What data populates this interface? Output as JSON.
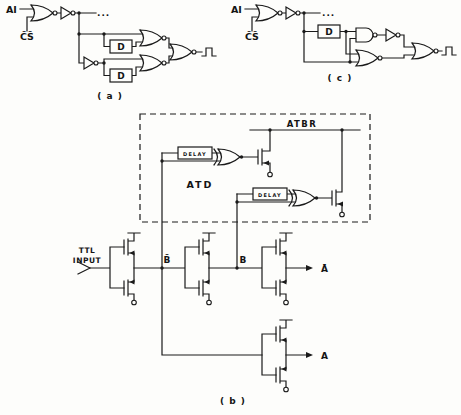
{
  "figure": {
    "panels": {
      "a": {
        "caption": "( a )",
        "address_input_label": "AI",
        "chip_select_label": "C̄S̄",
        "delay_blocks": [
          "D",
          "D"
        ],
        "continuation_dots": "..."
      },
      "c": {
        "caption": "( c )",
        "address_input_label": "AI",
        "chip_select_label": "C̄S̄",
        "delay_blocks": [
          "D"
        ],
        "continuation_dots": "..."
      },
      "b": {
        "caption": "( b )",
        "block_labels": {
          "atd": "ATD",
          "atbr": "ATBR"
        },
        "delay_blocks": [
          "DELAY",
          "DELAY"
        ],
        "input_label_line1": "TTL",
        "input_label_line2": "INPUT",
        "node_labels": {
          "b_bar": "B̄",
          "b": "B",
          "a_bar": "Ā",
          "a": "A"
        }
      }
    }
  }
}
